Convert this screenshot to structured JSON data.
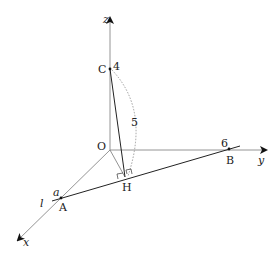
{
  "diagram": {
    "type": "3d-coordinate-geometry",
    "axes": {
      "x": "x",
      "y": "y",
      "z": "z"
    },
    "points": {
      "origin": "O",
      "A": "A",
      "B": "B",
      "C": "C",
      "H": "H"
    },
    "values": {
      "C_z": "4",
      "B_y": "6",
      "CH_length": "5",
      "A_x": "a"
    },
    "line_label": "l"
  }
}
